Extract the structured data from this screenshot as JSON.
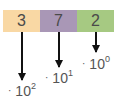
{
  "digits": [
    {
      "value": "3",
      "color": "#f9d8a4"
    },
    {
      "value": "7",
      "color": "#a997b6"
    },
    {
      "value": "2",
      "color": "#a6c982"
    }
  ],
  "labels": [
    {
      "prefix": "·",
      "base": "10",
      "exponent": "2"
    },
    {
      "prefix": "·",
      "base": "10",
      "exponent": "1"
    },
    {
      "prefix": "·",
      "base": "10",
      "exponent": "0"
    }
  ],
  "arrow_color": "#111111"
}
